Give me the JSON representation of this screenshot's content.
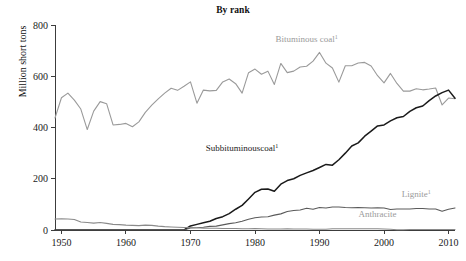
{
  "chart_data": {
    "type": "line",
    "title": "By rank",
    "xlabel": "",
    "ylabel": "Million short tons",
    "xlim": [
      1949,
      2011
    ],
    "ylim": [
      0,
      800
    ],
    "xticks": [
      1950,
      1960,
      1970,
      1980,
      1990,
      2000,
      2010
    ],
    "yticks": [
      0,
      200,
      400,
      600,
      800
    ],
    "grid": false,
    "legend_position": "inline-annotations",
    "x": [
      1949,
      1950,
      1951,
      1952,
      1953,
      1954,
      1955,
      1956,
      1957,
      1958,
      1959,
      1960,
      1961,
      1962,
      1963,
      1964,
      1965,
      1966,
      1967,
      1968,
      1969,
      1970,
      1971,
      1972,
      1973,
      1974,
      1975,
      1976,
      1977,
      1978,
      1979,
      1980,
      1981,
      1982,
      1983,
      1984,
      1985,
      1986,
      1987,
      1988,
      1989,
      1990,
      1991,
      1992,
      1993,
      1994,
      1995,
      1996,
      1997,
      1998,
      1999,
      2000,
      2001,
      2002,
      2003,
      2004,
      2005,
      2006,
      2007,
      2008,
      2009,
      2010,
      2011
    ],
    "series": [
      {
        "name": "Bituminous coal",
        "label": "Bituminous coal",
        "superscript": "1",
        "color": "#9a9a9a",
        "label_color": "#9a9a9a",
        "label_x": 1988,
        "label_y": 735,
        "values": [
          437,
          516,
          534,
          507,
          472,
          392,
          464,
          501,
          493,
          410,
          412,
          416,
          403,
          422,
          459,
          487,
          512,
          534,
          553,
          545,
          561,
          578,
          495,
          546,
          543,
          545,
          578,
          589,
          571,
          534,
          614,
          628,
          608,
          620,
          568,
          650,
          614,
          620,
          636,
          639,
          659,
          693,
          651,
          632,
          577,
          641,
          641,
          652,
          654,
          640,
          602,
          574,
          611,
          572,
          542,
          542,
          551,
          547,
          550,
          554,
          488,
          515,
          512
        ]
      },
      {
        "name": "Subbituminous coal",
        "label": "Subbituminouscoal",
        "superscript": "1",
        "color": "#1a1a1a",
        "label_color": "#1a1a1a",
        "label_x": 1978,
        "label_y": 310,
        "values": [
          0,
          0,
          0,
          0,
          0,
          0,
          0,
          0,
          0,
          0,
          0,
          0,
          0,
          0,
          0,
          0,
          0,
          0,
          0,
          0,
          0,
          16,
          22,
          28,
          34,
          45,
          52,
          64,
          81,
          96,
          121,
          147,
          159,
          160,
          151,
          179,
          193,
          200,
          213,
          223,
          232,
          244,
          256,
          253,
          274,
          300,
          328,
          340,
          366,
          386,
          406,
          410,
          426,
          438,
          443,
          463,
          477,
          484,
          505,
          523,
          536,
          546,
          514
        ]
      },
      {
        "name": "Lignite",
        "label": "Lignite",
        "superscript": "1",
        "color": "#5a5a5a",
        "label_color": "#9a9a9a",
        "label_x": 2005,
        "label_y": 128,
        "values": [
          0,
          0,
          0,
          0,
          0,
          0,
          0,
          0,
          0,
          0,
          0,
          0,
          0,
          0,
          0,
          0,
          0,
          0,
          0,
          0,
          0,
          8,
          9,
          11,
          14,
          15,
          20,
          25,
          28,
          34,
          42,
          48,
          51,
          52,
          58,
          63,
          72,
          76,
          78,
          85,
          81,
          88,
          86,
          90,
          90,
          88,
          87,
          88,
          87,
          86,
          87,
          86,
          80,
          82,
          82,
          82,
          84,
          84,
          82,
          82,
          73,
          81,
          86
        ]
      },
      {
        "name": "Anthracite",
        "label": "Anthracite",
        "superscript": "",
        "color": "#8a8a8a",
        "label_color": "#9a9a9a",
        "label_x": 1999,
        "label_y": 50,
        "values": [
          43,
          44,
          43,
          41,
          31,
          29,
          27,
          29,
          26,
          22,
          21,
          19,
          18,
          17,
          19,
          18,
          15,
          13,
          12,
          11,
          10,
          10,
          9,
          7,
          7,
          7,
          6,
          6,
          6,
          5,
          5,
          6,
          5,
          4,
          4,
          4,
          5,
          4,
          4,
          4,
          3,
          3,
          3,
          5,
          5,
          5,
          5,
          5,
          5,
          5,
          5,
          4,
          3,
          1,
          1,
          2,
          2,
          2,
          2,
          2,
          2,
          2,
          2
        ]
      }
    ]
  },
  "axes": {
    "y_tick_labels": [
      "0",
      "200",
      "400",
      "600",
      "800"
    ],
    "x_tick_labels": [
      "1950",
      "1960",
      "1970",
      "1980",
      "1990",
      "2000",
      "2010"
    ]
  },
  "colors": {
    "bituminous": "#9a9a9a",
    "subbituminous": "#1a1a1a",
    "lignite": "#5a5a5a",
    "anthracite": "#8a8a8a",
    "axis": "#3c3c3c",
    "text": "#1a1a1a",
    "background": "#ffffff"
  }
}
